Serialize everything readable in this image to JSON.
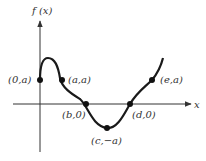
{
  "diagram": {
    "type": "function-graph",
    "y_axis_label": "f (x)",
    "x_axis_label": "x",
    "colors": {
      "axis": "#333333",
      "curve": "#1a1a1a",
      "points": "#111111",
      "background": "#ffffff"
    },
    "points": [
      {
        "id": "p0a",
        "label": "(0,a)"
      },
      {
        "id": "paa",
        "label": "(a,a)"
      },
      {
        "id": "pb0",
        "label": "(b,0)"
      },
      {
        "id": "pcna",
        "label": "(c,−a)"
      },
      {
        "id": "pd0",
        "label": "(d,0)"
      },
      {
        "id": "pea",
        "label": "(e,a)"
      }
    ]
  }
}
